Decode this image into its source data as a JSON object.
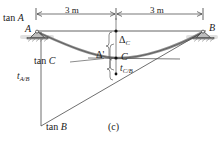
{
  "figure": {
    "caption": "(c)",
    "type": "beam-deflection-diagram",
    "colors": {
      "line": "#3c3c3c",
      "beam_curve": "#6e6e6e",
      "support_fill": "#b9b9b9",
      "text": "#1a1a1a",
      "ground_shadow": "#d6d6d6"
    }
  },
  "dimensions": [
    {
      "id": "left-span",
      "label": "3 m"
    },
    {
      "id": "right-span",
      "label": "3 m"
    }
  ],
  "points": [
    {
      "id": "A",
      "label": "A"
    },
    {
      "id": "B",
      "label": "B"
    },
    {
      "id": "C",
      "label": "C"
    }
  ],
  "tangents": [
    {
      "id": "tan-A",
      "prefix": "tan ",
      "point": "A"
    },
    {
      "id": "tan-B",
      "prefix": "tan ",
      "point": "B"
    },
    {
      "id": "tan-C",
      "prefix": "tan ",
      "point": "C"
    }
  ],
  "deflections": [
    {
      "id": "delta-c",
      "symbol": "Δ",
      "sub": "C",
      "label": "Δ"
    },
    {
      "id": "delta-prime",
      "symbol": "Δ",
      "sub": "",
      "label": "Δ'"
    }
  ],
  "deviations": [
    {
      "id": "t-a-b",
      "symbol": "t",
      "sub": "A/B"
    },
    {
      "id": "t-c-b",
      "symbol": "t",
      "sub": "C/B"
    }
  ],
  "supports": [
    {
      "id": "support-A",
      "kind": "pin-support"
    },
    {
      "id": "support-B",
      "kind": "pin-support"
    }
  ]
}
